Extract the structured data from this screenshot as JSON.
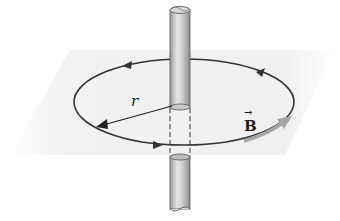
{
  "figure": {
    "labels": {
      "radius": "r",
      "field": "B",
      "field_vector_arrow": "→"
    },
    "elements": {
      "wire": "vertical cylindrical conductor",
      "field_loop": "circular field line (drawn as ellipse in perspective) with direction arrows",
      "plane": "light grey horizontal plane",
      "radius_arrow": "arrow from wire to loop",
      "field_vector": "grey tangent arrow on loop"
    },
    "colors": {
      "plane": "#efefef",
      "loop": "#333333",
      "wire_light": "#e8e8e8",
      "wire_dark": "#8a8a8a",
      "field_vector": "#a6a6a6"
    }
  }
}
